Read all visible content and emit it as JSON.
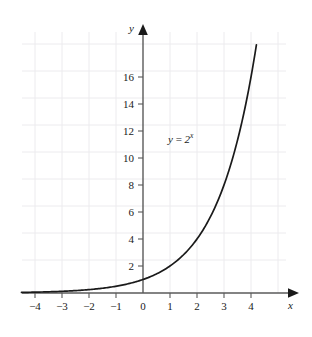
{
  "figure": {
    "title": "",
    "background_color": "#ffffff",
    "axis_color": "#4a4a4a",
    "grid_color": "#eceaee",
    "curve_color": "#1a1a1a"
  },
  "axes": {
    "x_letter": "x",
    "y_letter": "y",
    "x_tick_labels": [
      "−4",
      "−3",
      "−2",
      "−1",
      "0",
      "1",
      "2",
      "3",
      "4"
    ],
    "y_tick_labels": [
      "2",
      "4",
      "6",
      "8",
      "10",
      "12",
      "14",
      "16"
    ]
  },
  "annotations": {
    "curve_label_lhs": "y",
    "curve_label_eq": "=",
    "curve_label_base": "2",
    "curve_label_exp": "x"
  },
  "chart_data": {
    "type": "line",
    "title": "",
    "xlabel": "x",
    "ylabel": "y",
    "xlim": [
      -4.8,
      4.6
    ],
    "ylim": [
      0,
      19.2
    ],
    "xticks": [
      -4,
      -3,
      -2,
      -1,
      0,
      1,
      2,
      3,
      4
    ],
    "yticks": [
      2,
      4,
      6,
      8,
      10,
      12,
      14,
      16
    ],
    "grid": true,
    "legend": null,
    "annotation": "y = 2^x",
    "series": [
      {
        "name": "y = 2^x",
        "equation": "y = 2^x",
        "x": [
          -4.5,
          -4,
          -3.5,
          -3,
          -2.5,
          -2,
          -1.5,
          -1,
          -0.5,
          0,
          0.5,
          1,
          1.5,
          2,
          2.5,
          3,
          3.5,
          4,
          4.2
        ],
        "values": [
          0.044,
          0.063,
          0.088,
          0.125,
          0.177,
          0.25,
          0.354,
          0.5,
          0.707,
          1,
          1.414,
          2,
          2.828,
          4,
          5.657,
          8,
          11.314,
          16,
          18.379
        ]
      }
    ]
  }
}
